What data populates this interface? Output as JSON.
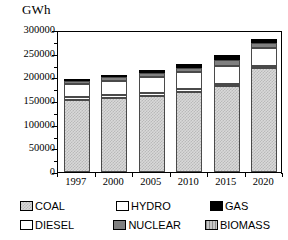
{
  "chart_data": {
    "type": "bar",
    "stacked": true,
    "title": "",
    "subtitle": "",
    "unit_label": "GWh",
    "xlabel": "",
    "ylabel": "GWh",
    "grid": false,
    "legend_position": "bottom",
    "categories": [
      "1997",
      "2000",
      "2005",
      "2010",
      "2015",
      "2020"
    ],
    "ylim": [
      0,
      300000
    ],
    "ytick_values": [
      0,
      50000,
      100000,
      150000,
      200000,
      250000,
      300000
    ],
    "ytick_labels": [
      "0",
      "50000",
      "100000",
      "150000",
      "200000",
      "250000",
      "300000"
    ],
    "series": [
      {
        "name": "COAL",
        "color": "#d9d9d9",
        "pattern": "checker",
        "values": [
          152000,
          157000,
          161000,
          170000,
          181000,
          219000
        ]
      },
      {
        "name": "DIESEL",
        "color": "#ffffff",
        "pattern": "solid",
        "values": [
          6000,
          6000,
          6000,
          6000,
          6000,
          6000
        ]
      },
      {
        "name": "HYDRO",
        "color": "#ffffff",
        "pattern": "solid",
        "values": [
          28000,
          30000,
          33000,
          35000,
          37000,
          38000
        ]
      },
      {
        "name": "NUCLEAR",
        "color": "#808080",
        "pattern": "solid",
        "values": [
          7000,
          8000,
          9000,
          9000,
          13000,
          9000
        ]
      },
      {
        "name": "GAS",
        "color": "#000000",
        "pattern": "solid",
        "values": [
          3000,
          4000,
          7000,
          8000,
          10000,
          8000
        ]
      },
      {
        "name": "BIOMASS",
        "color": "#c6c6c6",
        "pattern": "stripe",
        "values": [
          0,
          0,
          0,
          0,
          0,
          0
        ]
      }
    ],
    "totals": [
      196000,
      205000,
      216000,
      228000,
      247000,
      280000
    ]
  },
  "legend": {
    "rows": [
      [
        {
          "label": "COAL",
          "key": "coal"
        },
        {
          "label": "HYDRO",
          "key": "hydro"
        },
        {
          "label": "GAS",
          "key": "gas"
        }
      ],
      [
        {
          "label": "DIESEL",
          "key": "diesel"
        },
        {
          "label": "NUCLEAR",
          "key": "nuclear"
        },
        {
          "label": "BIOMASS",
          "key": "biomass"
        }
      ]
    ]
  }
}
